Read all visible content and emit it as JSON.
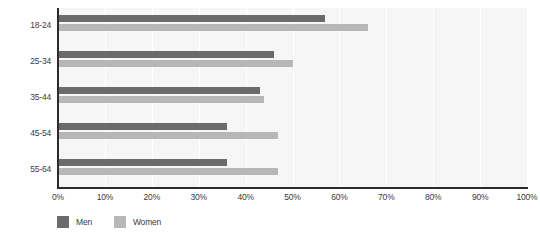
{
  "chart_data": {
    "type": "bar",
    "orientation": "horizontal",
    "title": "",
    "subtitle": "",
    "xlabel": "",
    "ylabel": "",
    "categories": [
      "18-24",
      "25-34",
      "35-44",
      "45-54",
      "55-64"
    ],
    "series": [
      {
        "name": "Men",
        "color": "#6b6b6b",
        "values": [
          57,
          46,
          43,
          36,
          36
        ]
      },
      {
        "name": "Women",
        "color": "#b7b7b7",
        "values": [
          66,
          50,
          44,
          47,
          47
        ]
      }
    ],
    "xlim": [
      0,
      100
    ],
    "xticks": [
      0,
      10,
      20,
      30,
      40,
      50,
      60,
      70,
      80,
      90,
      100
    ],
    "xtick_labels": [
      "0%",
      "10%",
      "20%",
      "30%",
      "40%",
      "50%",
      "60%",
      "70%",
      "80%",
      "90%",
      "100%"
    ],
    "grid": true,
    "grid_axis": "x",
    "legend": [
      "Men",
      "Women"
    ],
    "legend_position": "bottom-left",
    "plot_background": "#f6f6f6",
    "axis_color": "#2b2b2b",
    "gridline_color": "#ffffff",
    "value_unit": "%"
  }
}
